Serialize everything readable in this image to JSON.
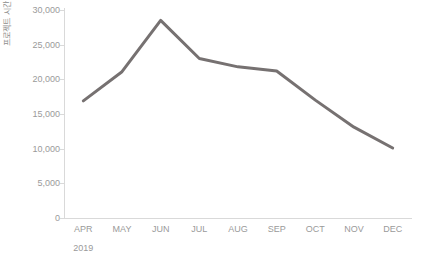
{
  "chart_data": {
    "type": "line",
    "title": "",
    "subtitle": "",
    "xlabel": "",
    "ylabel": "프로젝트 시간",
    "categories": [
      "APR",
      "MAY",
      "JUN",
      "JUL",
      "AUG",
      "SEP",
      "OCT",
      "NOV",
      "DEC"
    ],
    "group_label": "2019",
    "series": [
      {
        "name": "프로젝트 시간",
        "color": "#767171",
        "values": [
          16900,
          21100,
          28500,
          23000,
          21800,
          21200,
          17000,
          13100,
          10100
        ]
      }
    ],
    "ylim": [
      0,
      30000
    ],
    "ytick_values": [
      0,
      5000,
      10000,
      15000,
      20000,
      25000,
      30000
    ],
    "ytick_labels": [
      "0",
      "5,000",
      "10,000",
      "15,000",
      "20,000",
      "25,000",
      "30,000"
    ],
    "grid": false,
    "legend": "none",
    "axis_color": "#d9d9d9",
    "tick_text_color": "#9a9a9a",
    "background": "#ffffff"
  }
}
